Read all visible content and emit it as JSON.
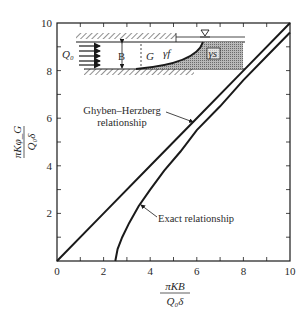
{
  "chart_data": {
    "type": "line",
    "title": "",
    "xlabel": "πKB / (Q₀δ)",
    "ylabel": "πKφ_G / (Q₀δ)",
    "xlim": [
      0,
      10
    ],
    "ylim": [
      0,
      10
    ],
    "x_ticks": [
      "0",
      "2",
      "4",
      "6",
      "8",
      "10"
    ],
    "y_ticks": [
      "2",
      "4",
      "6",
      "8",
      "10"
    ],
    "grid": false,
    "series": [
      {
        "name": "Ghyben–Herzberg relationship",
        "x": [
          0,
          2,
          4,
          6,
          8,
          10
        ],
        "y": [
          0,
          2,
          4,
          6,
          8,
          10
        ]
      },
      {
        "name": "Exact relationship",
        "x": [
          2.5,
          2.6,
          2.8,
          3.1,
          3.5,
          4.0,
          4.6,
          5.3,
          6.0,
          7.0,
          8.0,
          9.0,
          10.0
        ],
        "y": [
          0,
          0.5,
          1.0,
          1.6,
          2.3,
          3.0,
          3.8,
          4.6,
          5.5,
          6.5,
          7.6,
          8.6,
          9.6
        ]
      }
    ],
    "annotations": [
      {
        "text_line1": "Ghyben–Herzberg",
        "text_line2": "relationship",
        "points_to": "Ghyben–Herzberg relationship"
      },
      {
        "text": "Exact relationship",
        "points_to": "Exact relationship"
      }
    ],
    "inset": {
      "description": "Confined coastal aquifer schematic with freshwater inflow and saltwater wedge",
      "labels": {
        "inflow": "Q₀",
        "thickness": "B",
        "toe": "G",
        "fresh_density": "γf",
        "salt_density": "γs"
      }
    }
  },
  "labels": {
    "x_num": "πKB",
    "x_den": "Q₀δ",
    "y_num": "πKφ_G",
    "y_den": "Q₀δ",
    "gh_line1": "Ghyben–Herzberg",
    "gh_line2": "relationship",
    "exact": "Exact relationship",
    "inset_q": "Q₀",
    "inset_b": "B",
    "inset_g": "G",
    "inset_gf": "γf",
    "inset_gs": "γs"
  },
  "colors": {
    "line": "#1a1a1a",
    "salt_fill": "#9a9a9a",
    "text": "#2a2a2a"
  }
}
